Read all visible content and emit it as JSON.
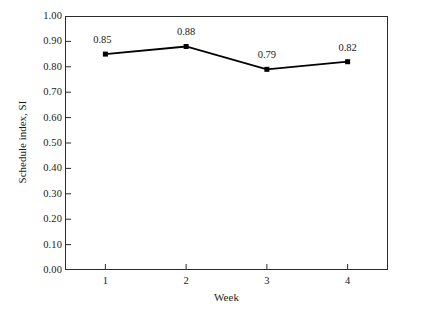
{
  "chart_data": {
    "type": "line",
    "title": "",
    "xlabel": "Week",
    "ylabel": "Schedule index, SI",
    "categories": [
      "1",
      "2",
      "3",
      "4"
    ],
    "x": [
      1,
      2,
      3,
      4
    ],
    "values": [
      0.85,
      0.88,
      0.79,
      0.82
    ],
    "point_labels": [
      "0.85",
      "0.88",
      "0.79",
      "0.82"
    ],
    "xlim": [
      0.5,
      4.5
    ],
    "ylim": [
      0.0,
      1.0
    ],
    "ytick_labels": [
      "0.00",
      "0.10",
      "0.20",
      "0.30",
      "0.40",
      "0.50",
      "0.60",
      "0.70",
      "0.80",
      "0.90",
      "1.00"
    ],
    "ytick_values": [
      0.0,
      0.1,
      0.2,
      0.3,
      0.4,
      0.5,
      0.6,
      0.7,
      0.8,
      0.9,
      1.0
    ],
    "xtick_labels": [
      "1",
      "2",
      "3",
      "4"
    ],
    "xtick_values": [
      1,
      2,
      3,
      4
    ],
    "grid": false,
    "legend": false,
    "series": [
      {
        "name": "Schedule index, SI",
        "values": [
          0.85,
          0.88,
          0.79,
          0.82
        ],
        "line_color": "#000000",
        "marker": "square",
        "marker_color": "#000000"
      }
    ],
    "colors": {
      "background": "#ffffff",
      "axis": "#2b2b2b",
      "line": "#000000",
      "marker": "#000000",
      "text": "#1a1a1a"
    }
  }
}
